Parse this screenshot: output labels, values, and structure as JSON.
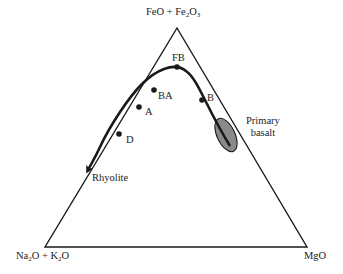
{
  "diagram": {
    "type": "AFM ternary diagram",
    "vertices": {
      "top": {
        "main": "FeO + Fe",
        "sub1": "2",
        "mid": "O",
        "sub2": "3"
      },
      "bottom_left": {
        "p1": "Na",
        "s1": "2",
        "p2": "O + K",
        "s2": "2",
        "p3": "O"
      },
      "bottom_right": "MgO"
    },
    "trend_points": [
      {
        "label": "FB"
      },
      {
        "label": "B"
      },
      {
        "label": "BA"
      },
      {
        "label": "A"
      },
      {
        "label": "D"
      }
    ],
    "end_label": "Rhyolite",
    "field": {
      "line1": "Primary",
      "line2": "basalt"
    },
    "colors": {
      "line": "#1a1a1a",
      "field_fill": "#8a8a8a"
    }
  }
}
